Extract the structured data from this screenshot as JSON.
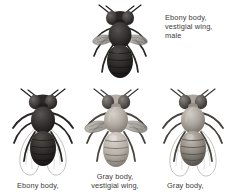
{
  "figure": {
    "background": "#ffffff",
    "text_color": "#3a3a3a"
  },
  "specimens": [
    {
      "id": "top-ebony-vestigial-male",
      "position": "top-center",
      "body_color_name": "Ebony",
      "wing_type": "vestigial",
      "sex": "male",
      "body_hex": "#2c2a29",
      "wing_hex": "#8e8b86",
      "label": "Ebony body,\nvestigial wing,\nmale"
    },
    {
      "id": "bottom-left-ebony-long",
      "position": "bottom-left",
      "body_color_name": "Ebony",
      "wing_type": "long",
      "body_hex": "#2f2d2b",
      "wing_hex": "#b9b6b1",
      "label": "Ebony body,"
    },
    {
      "id": "bottom-center-gray-vestigial",
      "position": "bottom-center",
      "body_color_name": "Gray",
      "wing_type": "vestigial",
      "body_hex": "#a9a49c",
      "wing_hex": "#8e8b86",
      "label": "Gray body,\nvestigial wing,"
    },
    {
      "id": "bottom-right-gray-long",
      "position": "bottom-right",
      "body_color_name": "Gray",
      "wing_type": "long",
      "body_hex": "#9c968e",
      "wing_hex": "#b9b6b1",
      "label": "Gray body,"
    }
  ],
  "labels": {
    "top_right": "Ebony body,\nvestigial wing,\nmale",
    "bottom_left": "Ebony body,",
    "bottom_center": "Gray body,\nvestigial wing,",
    "bottom_right": "Gray body,"
  }
}
